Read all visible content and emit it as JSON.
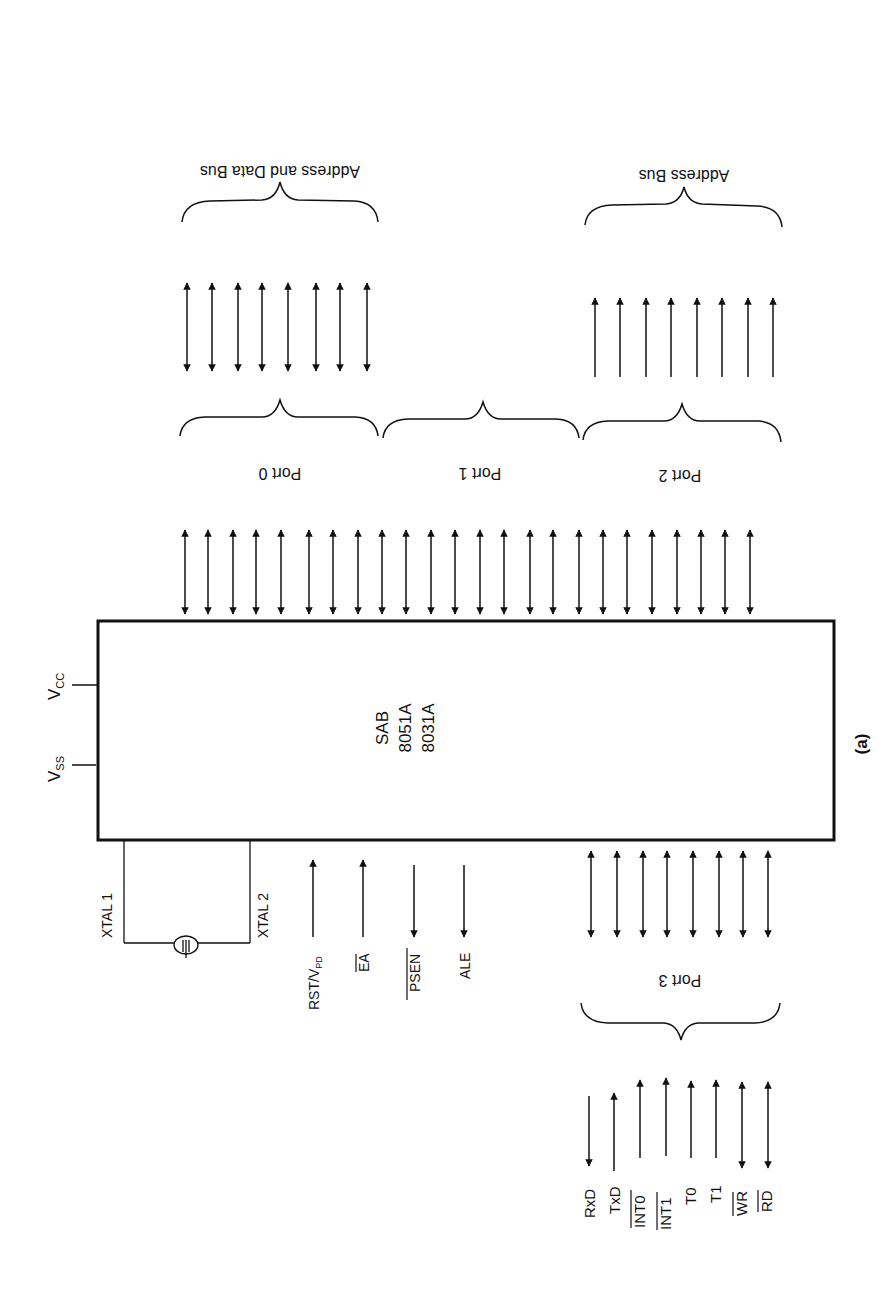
{
  "diagram": {
    "chip": {
      "line1": "SAB",
      "line2": "8051A",
      "line3": "8031A"
    },
    "power": {
      "vcc": "V",
      "vcc_sub": "CC",
      "vss": "V",
      "vss_sub": "SS"
    },
    "ports": {
      "port0": "Port 0",
      "port1": "Port 1",
      "port2": "Port 2",
      "port3": "Port 3"
    },
    "buses": {
      "address_data": "Address and Data Bus",
      "address": "Address Bus"
    },
    "crystal": {
      "xtal1": "XTAL 1",
      "xtal2": "XTAL 2"
    },
    "control_signals": [
      {
        "label": "RST/V",
        "sub": "PD",
        "direction": "in"
      },
      {
        "label": "EA",
        "overbar": true,
        "direction": "in"
      },
      {
        "label": "PSEN",
        "overbar": true,
        "direction": "out"
      },
      {
        "label": "ALE",
        "direction": "out"
      }
    ],
    "port3_functions": [
      {
        "label": "RxD",
        "direction": "in"
      },
      {
        "label": "TxD",
        "direction": "out"
      },
      {
        "label": "INT0",
        "overbar": true,
        "direction": "in"
      },
      {
        "label": "INT1",
        "overbar": true,
        "direction": "in"
      },
      {
        "label": "T0",
        "direction": "in"
      },
      {
        "label": "T1",
        "direction": "in"
      },
      {
        "label": "WR",
        "overbar": true,
        "direction": "bidirectional"
      },
      {
        "label": "RD",
        "overbar": true,
        "direction": "bidirectional"
      }
    ],
    "caption": "(a)"
  }
}
